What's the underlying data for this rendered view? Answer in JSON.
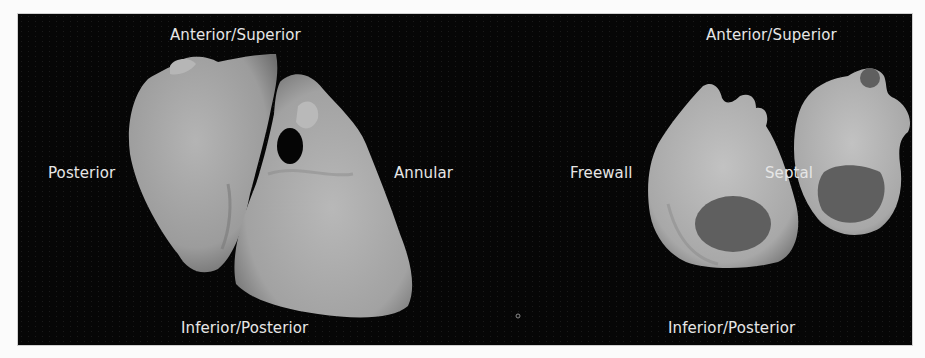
{
  "figure": {
    "background_color": "#060606",
    "tissue_color": "#a9a9a9",
    "orifice_color": "#5e5e5e",
    "left_view": {
      "labels": {
        "top": "Anterior/Superior",
        "left": "Posterior",
        "right": "Annular",
        "bottom": "Inferior/Posterior"
      }
    },
    "right_view": {
      "labels": {
        "top": "Anterior/Superior",
        "left": "Freewall",
        "center": "Septal",
        "bottom": "Inferior/Posterior"
      }
    }
  }
}
